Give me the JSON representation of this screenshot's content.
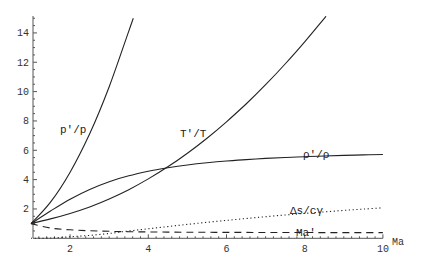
{
  "chart_data": {
    "type": "line",
    "title": "",
    "xlabel": "Ma",
    "ylabel": "",
    "xlim": [
      1,
      10
    ],
    "ylim": [
      0,
      15
    ],
    "grid": false,
    "legend": "inline labels",
    "x_ticks": [
      2,
      4,
      6,
      8,
      10
    ],
    "y_ticks": [
      2,
      4,
      6,
      8,
      10,
      12,
      14
    ],
    "x": [
      1,
      1.5,
      2,
      2.5,
      3,
      3.5,
      4,
      4.5,
      5,
      5.5,
      6,
      6.5,
      7,
      7.5,
      8,
      8.5,
      9,
      9.5,
      10
    ],
    "series": [
      {
        "name": "p'/p",
        "style": "solid",
        "values": [
          1.0,
          2.458,
          4.5,
          7.125,
          10.333,
          14.125,
          null,
          null,
          null,
          null,
          null,
          null,
          null,
          null,
          null,
          null,
          null,
          null,
          null
        ],
        "label_pos": {
          "x": 60,
          "y": 133
        }
      },
      {
        "name": "T'/T",
        "style": "solid",
        "values": [
          1.0,
          1.32,
          1.688,
          2.137,
          2.679,
          3.315,
          4.047,
          4.875,
          5.8,
          6.822,
          7.941,
          9.158,
          10.469,
          11.88,
          13.387,
          14.99,
          null,
          null,
          null
        ],
        "label_pos": {
          "x": 180,
          "y": 137
        }
      },
      {
        "name": "ρ'/ρ",
        "style": "solid",
        "values": [
          1.0,
          1.862,
          2.667,
          3.333,
          3.857,
          4.261,
          4.571,
          4.812,
          5.0,
          5.149,
          5.268,
          5.366,
          5.444,
          5.51,
          5.565,
          5.612,
          5.651,
          5.686,
          5.714
        ],
        "label_pos": {
          "x": 303,
          "y": 158
        }
      },
      {
        "name": "Δs/cγ",
        "style": "dotted",
        "values": [
          0.0,
          0.02,
          0.1,
          0.2,
          0.33,
          0.5,
          0.65,
          0.8,
          0.95,
          1.09,
          1.22,
          1.35,
          1.47,
          1.59,
          1.7,
          1.8,
          1.9,
          1.99,
          2.08
        ],
        "label_pos": {
          "x": 290,
          "y": 214
        }
      },
      {
        "name": "Ma'",
        "style": "dashed",
        "values": [
          1.0,
          0.701,
          0.577,
          0.513,
          0.475,
          0.451,
          0.435,
          0.424,
          0.415,
          0.409,
          0.404,
          0.4,
          0.397,
          0.395,
          0.393,
          0.391,
          0.39,
          0.389,
          0.388
        ],
        "label_pos": {
          "x": 296,
          "y": 236
        }
      }
    ]
  },
  "axes": {
    "x_label": "Ma",
    "x_tick_labels": [
      "2",
      "4",
      "6",
      "8",
      "10"
    ],
    "y_tick_labels": [
      "2",
      "4",
      "6",
      "8",
      "10",
      "12",
      "14"
    ]
  }
}
